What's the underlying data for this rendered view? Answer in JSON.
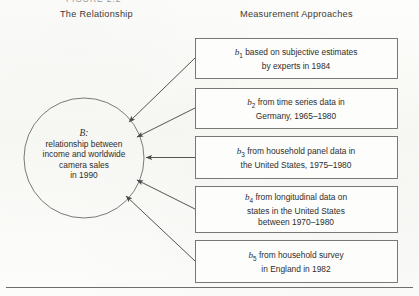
{
  "figure": {
    "clipped_caption": "FIGURE 2.2",
    "headers": {
      "left": "The Relationship",
      "right": "Measurement Approaches"
    },
    "relationship_node": {
      "symbol": "B:",
      "line1": "relationship between",
      "line2": "income and worldwide",
      "line3": "camera sales",
      "line4": "in 1990"
    },
    "measurement_boxes": [
      {
        "symbol": "b",
        "subscript": "1",
        "line1": "based on subjective estimates",
        "line2": "by experts in 1984",
        "line3": ""
      },
      {
        "symbol": "b",
        "subscript": "2",
        "line1": "from time series data in",
        "line2": "Germany, 1965–1980",
        "line3": ""
      },
      {
        "symbol": "b",
        "subscript": "3",
        "line1": "from household panel data in",
        "line2": "the United States, 1975–1980",
        "line3": ""
      },
      {
        "symbol": "b",
        "subscript": "4",
        "line1": "from longitudinal data on",
        "line2": "states in the United States",
        "line3": "between 1970–1980"
      },
      {
        "symbol": "b",
        "subscript": "5",
        "line1": "from household survey",
        "line2": "in England in 1982",
        "line3": ""
      }
    ],
    "colors": {
      "line": "#6b6b69",
      "text": "#2e2e2c",
      "background": "#fbfbf9"
    }
  }
}
